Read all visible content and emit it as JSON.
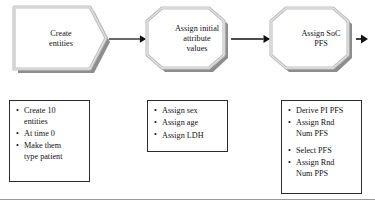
{
  "diagram": {
    "type": "process-flow",
    "title": "",
    "colors": {
      "shape_fill": "#ffffff",
      "shape_border_light": "#cfcfcf",
      "shape_border_dark": "#8d8d8d",
      "shape_shadow": "#8d8d8d",
      "text": "#121212",
      "box_border": "#2b2b2b",
      "connector": "#111111",
      "footer_rule": "#9a9a9a"
    },
    "nodes": [
      {
        "id": "create-entities",
        "shape": "pentagon",
        "label": "Create\nentities",
        "x": 14,
        "y": 8,
        "width": 94,
        "height": 62
      },
      {
        "id": "assign-initial-attribute-values",
        "shape": "octagon",
        "label": "Assign initial\nattribute\nvalues",
        "x": 148,
        "y": 8,
        "width": 82,
        "height": 62
      },
      {
        "id": "assign-soc-pfs",
        "shape": "octagon",
        "label": "Assign SoC\nPFS",
        "x": 272,
        "y": 8,
        "width": 82,
        "height": 62
      }
    ],
    "connectors": [
      {
        "id": "arrow-1",
        "from": "create-entities",
        "to": "assign-initial-attribute-values"
      },
      {
        "id": "arrow-2",
        "from": "assign-initial-attribute-values",
        "to": "assign-soc-pfs"
      },
      {
        "id": "arrow-3",
        "from": "assign-soc-pfs",
        "to": "offscreen"
      }
    ],
    "detail_boxes": [
      {
        "id": "create-entities-details",
        "for": "create-entities",
        "x": 9,
        "y": 100,
        "width": 81,
        "height": 82,
        "items": [
          {
            "text": "Create 10\nentities",
            "gap_before": false
          },
          {
            "text": "At time 0",
            "gap_before": false
          },
          {
            "text": "Make them\ntype patient",
            "gap_before": false
          }
        ]
      },
      {
        "id": "assign-initial-attribute-values-details",
        "for": "assign-initial-attribute-values",
        "x": 147,
        "y": 100,
        "width": 81,
        "height": 52,
        "items": [
          {
            "text": "Assign sex",
            "gap_before": false
          },
          {
            "text": "Assign age",
            "gap_before": false
          },
          {
            "text": "Assign LDH",
            "gap_before": false
          }
        ]
      },
      {
        "id": "assign-soc-pfs-details",
        "for": "assign-soc-pfs",
        "x": 281,
        "y": 100,
        "width": 81,
        "height": 94,
        "items": [
          {
            "text": "Derive PI PFS",
            "gap_before": false
          },
          {
            "text": "Assign Rnd\nNum PFS",
            "gap_before": false
          },
          {
            "text": "Select PFS",
            "gap_before": true
          },
          {
            "text": "Assign Rnd\nNum PPS",
            "gap_before": false
          }
        ]
      }
    ],
    "bullet_glyph": "•",
    "footer": {
      "rule_y": 199
    }
  }
}
